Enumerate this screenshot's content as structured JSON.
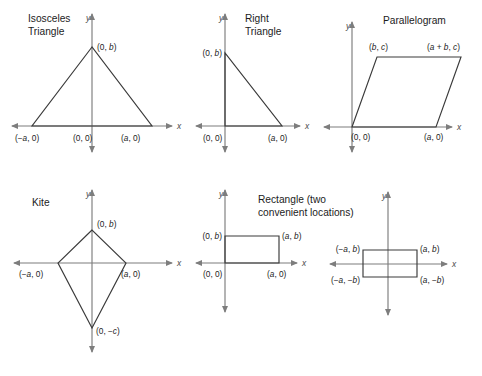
{
  "figure": {
    "background_color": "#ffffff",
    "axis_color": "#7d7d7d",
    "shape_color": "#3a3a3a",
    "text_color": "#1c1c1c",
    "width": 482,
    "height": 376
  },
  "panels": [
    {
      "id": "isosceles-triangle",
      "title_lines": [
        "Isosceles",
        "Triangle"
      ],
      "title_x": 28,
      "title_y": 22,
      "title_anchor": "start",
      "origin": {
        "x": 92,
        "y": 126
      },
      "x_axis": {
        "x1": 12,
        "x2": 172,
        "y": 126
      },
      "y_axis": {
        "y1": 14,
        "y2": 152,
        "x": 92
      },
      "x_axis_label": "x",
      "y_axis_label": "y",
      "x_label_pos": {
        "x": 177,
        "y": 129
      },
      "y_label_pos": {
        "x": 86,
        "y": 21
      },
      "shape_type": "polygon",
      "points": [
        [
          92,
          47
        ],
        [
          32,
          126
        ],
        [
          152,
          126
        ]
      ],
      "closed": true,
      "vertex_labels": [
        {
          "text": "(0, b)",
          "italics": "b",
          "x": 97,
          "y": 50,
          "anchor": "start"
        },
        {
          "text": "(−a, 0)",
          "italics": "a",
          "x": 15,
          "y": 141,
          "anchor": "start"
        },
        {
          "text": "(0, 0)",
          "italics": "",
          "x": 73,
          "y": 141,
          "anchor": "start"
        },
        {
          "text": "(a, 0)",
          "italics": "a",
          "x": 121,
          "y": 141,
          "anchor": "start"
        }
      ]
    },
    {
      "id": "right-triangle",
      "title_lines": [
        "Right",
        "Triangle"
      ],
      "title_x": 245,
      "title_y": 22,
      "title_anchor": "start",
      "origin": {
        "x": 225,
        "y": 126
      },
      "x_axis": {
        "x1": 196,
        "x2": 300,
        "y": 126
      },
      "y_axis": {
        "y1": 14,
        "y2": 152,
        "x": 225
      },
      "x_axis_label": "x",
      "y_axis_label": "y",
      "x_label_pos": {
        "x": 305,
        "y": 129
      },
      "y_label_pos": {
        "x": 219,
        "y": 21
      },
      "shape_type": "polygon",
      "points": [
        [
          225,
          53
        ],
        [
          225,
          126
        ],
        [
          282,
          126
        ]
      ],
      "closed": true,
      "vertex_labels": [
        {
          "text": "(0, b)",
          "italics": "b",
          "x": 222,
          "y": 56,
          "anchor": "end"
        },
        {
          "text": "(0, 0)",
          "italics": "",
          "x": 203,
          "y": 141,
          "anchor": "start"
        },
        {
          "text": "(a, 0)",
          "italics": "a",
          "x": 268,
          "y": 141,
          "anchor": "start"
        }
      ]
    },
    {
      "id": "parallelogram",
      "title_lines": [
        "Parallelogram"
      ],
      "title_x": 383,
      "title_y": 24,
      "title_anchor": "start",
      "origin": {
        "x": 352,
        "y": 127
      },
      "x_axis": {
        "x1": 324,
        "x2": 452,
        "y": 127
      },
      "y_axis": {
        "y1": 22,
        "y2": 152,
        "x": 352
      },
      "x_axis_label": "x",
      "y_axis_label": "y",
      "x_label_pos": {
        "x": 457,
        "y": 130
      },
      "y_label_pos": {
        "x": 346,
        "y": 29
      },
      "shape_type": "polygon",
      "points": [
        [
          352,
          127
        ],
        [
          377,
          57
        ],
        [
          461,
          57
        ],
        [
          436,
          127
        ]
      ],
      "closed": true,
      "vertex_labels": [
        {
          "text": "(b, c)",
          "italics": "bc",
          "x": 369,
          "y": 50,
          "anchor": "start"
        },
        {
          "text": "(a + b, c)",
          "italics": "abc",
          "x": 427,
          "y": 50,
          "anchor": "start"
        },
        {
          "text": "(0, 0)",
          "italics": "",
          "x": 351,
          "y": 140,
          "anchor": "start"
        },
        {
          "text": "(a, 0)",
          "italics": "a",
          "x": 424,
          "y": 140,
          "anchor": "start"
        }
      ]
    },
    {
      "id": "kite",
      "title_lines": [
        "Kite"
      ],
      "title_x": 32,
      "title_y": 206,
      "title_anchor": "start",
      "origin": {
        "x": 92,
        "y": 263
      },
      "x_axis": {
        "x1": 14,
        "x2": 172,
        "y": 263
      },
      "y_axis": {
        "y1": 190,
        "y2": 352,
        "x": 92
      },
      "x_axis_label": "x",
      "y_axis_label": "y",
      "x_label_pos": {
        "x": 177,
        "y": 266
      },
      "y_label_pos": {
        "x": 86,
        "y": 197
      },
      "shape_type": "polygon",
      "points": [
        [
          92,
          230
        ],
        [
          58,
          263
        ],
        [
          92,
          328
        ],
        [
          126,
          263
        ]
      ],
      "closed": true,
      "vertex_labels": [
        {
          "text": "(0, b)",
          "italics": "b",
          "x": 97,
          "y": 227,
          "anchor": "start"
        },
        {
          "text": "(−a, 0)",
          "italics": "a",
          "x": 19,
          "y": 277,
          "anchor": "start"
        },
        {
          "text": "(a, 0)",
          "italics": "a",
          "x": 121,
          "y": 277,
          "anchor": "start"
        },
        {
          "text": "(0, −c)",
          "italics": "c",
          "x": 96,
          "y": 334,
          "anchor": "start"
        }
      ]
    },
    {
      "id": "rectangle-first-quadrant",
      "title_lines": [
        "Rectangle (two",
        "convenient locations)"
      ],
      "title_x": 258,
      "title_y": 203,
      "title_anchor": "start",
      "origin": {
        "x": 225,
        "y": 263
      },
      "x_axis": {
        "x1": 196,
        "x2": 297,
        "y": 263
      },
      "y_axis": {
        "y1": 190,
        "y2": 312,
        "x": 225
      },
      "x_axis_label": "x",
      "y_axis_label": "y",
      "x_label_pos": {
        "x": 302,
        "y": 266
      },
      "y_label_pos": {
        "x": 219,
        "y": 197
      },
      "shape_type": "rect",
      "points": [
        [
          225,
          236
        ],
        [
          279,
          236
        ],
        [
          279,
          263
        ],
        [
          225,
          263
        ]
      ],
      "closed": true,
      "vertex_labels": [
        {
          "text": "(0, b)",
          "italics": "b",
          "x": 222,
          "y": 239,
          "anchor": "end"
        },
        {
          "text": "(a, b)",
          "italics": "ab",
          "x": 282,
          "y": 239,
          "anchor": "start"
        },
        {
          "text": "(0, 0)",
          "italics": "",
          "x": 203,
          "y": 277,
          "anchor": "start"
        },
        {
          "text": "(a, 0)",
          "italics": "a",
          "x": 267,
          "y": 277,
          "anchor": "start"
        }
      ]
    },
    {
      "id": "rectangle-centered",
      "title_lines": [],
      "title_x": 0,
      "title_y": 0,
      "title_anchor": "start",
      "origin": {
        "x": 388,
        "y": 264
      },
      "x_axis": {
        "x1": 330,
        "x2": 447,
        "y": 264
      },
      "y_axis": {
        "y1": 192,
        "y2": 315,
        "x": 388
      },
      "x_axis_label": "x",
      "y_axis_label": "y",
      "x_label_pos": {
        "x": 452,
        "y": 267
      },
      "y_label_pos": {
        "x": 382,
        "y": 199
      },
      "shape_type": "rect",
      "points": [
        [
          363,
          250
        ],
        [
          417,
          250
        ],
        [
          417,
          277
        ],
        [
          363,
          277
        ]
      ],
      "closed": true,
      "vertex_labels": [
        {
          "text": "(−a, b)",
          "italics": "ab",
          "x": 360,
          "y": 252,
          "anchor": "end"
        },
        {
          "text": "(a, b)",
          "italics": "ab",
          "x": 420,
          "y": 252,
          "anchor": "start"
        },
        {
          "text": "(−a, −b)",
          "italics": "ab",
          "x": 360,
          "y": 283,
          "anchor": "end"
        },
        {
          "text": "(a, −b)",
          "italics": "ab",
          "x": 420,
          "y": 283,
          "anchor": "start"
        }
      ]
    }
  ]
}
